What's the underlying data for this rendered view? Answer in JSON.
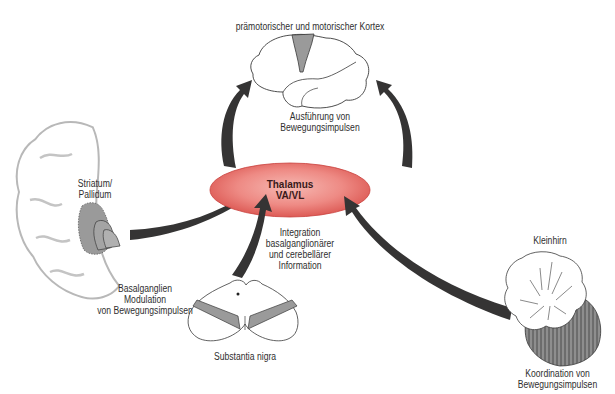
{
  "colors": {
    "thalamus_fill": "#e8716c",
    "thalamus_edge": "#c9403c",
    "arrow": "#353434",
    "gray_region": "#9a9a9a",
    "outline": "#3a3a3a",
    "faint_outline": "#b8b8b8"
  },
  "nodes": {
    "cortex": {
      "title": "prämotorischer und motorischer Kortex",
      "caption_line1": "Ausführung von",
      "caption_line2": "Bewegungsimpulsen",
      "icon": "brain-lateral-icon"
    },
    "thalamus": {
      "line1": "Thalamus",
      "line2": "VA/VL",
      "caption_line1": "Integration",
      "caption_line2": "basalganglionärer",
      "caption_line3": "und cerebellärer",
      "caption_line4": "Information"
    },
    "basal_ganglia": {
      "label_line1": "Striatum/",
      "label_line2": "Pallidum",
      "caption_line1": "Basalganglien",
      "caption_line2": "Modulation",
      "caption_line3": "von Bewegungsimpulsen",
      "icon": "brain-coronal-icon"
    },
    "substantia_nigra": {
      "label": "Substantia nigra",
      "icon": "midbrain-section-icon"
    },
    "cerebellum": {
      "label": "Kleinhirn",
      "caption_line1": "Koordination von",
      "caption_line2": "Bewegungsimpulsen",
      "icon": "cerebellum-icon"
    }
  },
  "connections": [
    {
      "from": "basal_ganglia",
      "to": "thalamus"
    },
    {
      "from": "substantia_nigra",
      "to": "thalamus"
    },
    {
      "from": "cerebellum",
      "to": "thalamus"
    },
    {
      "from": "thalamus",
      "to": "cortex",
      "side": "left"
    },
    {
      "from": "thalamus",
      "to": "cortex",
      "side": "right"
    }
  ]
}
